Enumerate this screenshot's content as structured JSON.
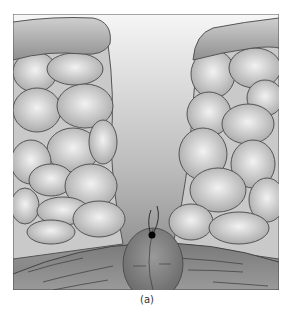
{
  "figure": {
    "caption": "(a)",
    "colors": {
      "background_top": "#f4f4f4",
      "background_bottom": "#8a8a8a",
      "cell_fill_light": "#e6e6e6",
      "cell_fill_dark": "#a9a9a9",
      "cell_outline": "#555555",
      "cap_fill": "#9a9a9a",
      "base_fill": "#6e6e6e",
      "dot": "#000000"
    }
  }
}
